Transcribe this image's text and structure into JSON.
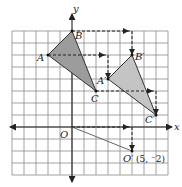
{
  "diagram": {
    "type": "coordinate-translation",
    "grid": {
      "x_min": -5,
      "x_max": 8,
      "y_min": -4,
      "y_max": 8,
      "cell_px": 12,
      "origin_px": [
        72,
        127
      ],
      "line_color": "#8a8a8a"
    },
    "axes": {
      "x_label": "x",
      "y_label": "y",
      "origin_label": "O",
      "color": "#222222"
    },
    "translation_vector": [
      5,
      -2
    ],
    "original_triangle": {
      "fill": "#9c9c9c",
      "vertices": [
        {
          "name": "A",
          "label": "A",
          "coord": [
            -2,
            6
          ]
        },
        {
          "name": "B",
          "label": "B",
          "coord": [
            0,
            8
          ]
        },
        {
          "name": "C",
          "label": "C",
          "coord": [
            2,
            3
          ]
        }
      ]
    },
    "image_triangle": {
      "fill": "#c4c4c4",
      "vertices": [
        {
          "name": "A'",
          "label": "A′",
          "coord": [
            3,
            4
          ]
        },
        {
          "name": "B'",
          "label": "B′",
          "coord": [
            5,
            6
          ]
        },
        {
          "name": "C'",
          "label": "C′",
          "coord": [
            7,
            1
          ]
        }
      ]
    },
    "origin_image": {
      "label": "O′",
      "coord_label": "(5, ⁻2)",
      "coord": [
        5,
        -2
      ]
    },
    "dashed_paths": [
      {
        "from": [
          0,
          8
        ],
        "corner": [
          5,
          8
        ],
        "to": [
          5,
          6
        ]
      },
      {
        "from": [
          -2,
          6
        ],
        "corner": [
          3,
          6
        ],
        "to": [
          3,
          4
        ]
      },
      {
        "from": [
          2,
          3
        ],
        "corner": [
          7,
          3
        ],
        "to": [
          7,
          1
        ]
      },
      {
        "from": [
          0,
          0
        ],
        "corner": [
          5,
          0
        ],
        "to": [
          5,
          -2
        ]
      }
    ]
  }
}
